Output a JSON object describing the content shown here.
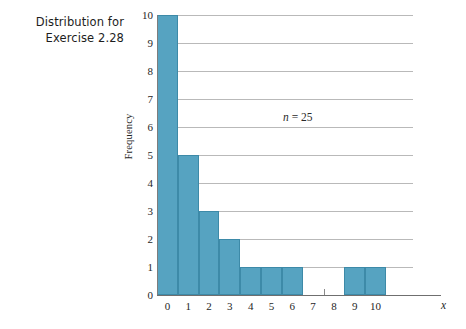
{
  "caption": {
    "line1": "Distribution for",
    "line2": "Exercise 2.28"
  },
  "annotation": {
    "symbol": "n",
    "equals": "=",
    "value": "25",
    "full": "n = 25"
  },
  "axis": {
    "y_title": "Frequency",
    "x_title": "x"
  },
  "colors": {
    "bar_fill": "#56a3c1",
    "bar_edge": "#3d8aa8",
    "grid": "#b9b9b9",
    "axis": "#6f6f6f",
    "background": "#ffffff",
    "text": "#262626"
  },
  "chart_data": {
    "type": "bar",
    "title": "Distribution for Exercise 2.28",
    "subtitle": "",
    "xlabel": "x",
    "ylabel": "Frequency",
    "categories": [
      "0",
      "1",
      "2",
      "3",
      "4",
      "5",
      "6",
      "7",
      "8",
      "9",
      "10"
    ],
    "x": [
      0,
      1,
      2,
      3,
      4,
      5,
      6,
      7,
      8,
      9,
      10
    ],
    "values": [
      10,
      5,
      3,
      2,
      1,
      1,
      1,
      0,
      0,
      1,
      1
    ],
    "xlim": [
      -0.5,
      11.8
    ],
    "ylim": [
      0,
      10
    ],
    "ytick_labels": [
      "0",
      "1",
      "2",
      "3",
      "4",
      "5",
      "6",
      "7",
      "8",
      "9",
      "10"
    ],
    "yticks": [
      0,
      1,
      2,
      3,
      4,
      5,
      6,
      7,
      8,
      9,
      10
    ],
    "xtick_labels": [
      "0",
      "1",
      "2",
      "3",
      "4",
      "5",
      "6",
      "7",
      "8",
      "9",
      "10"
    ],
    "xticks": [
      0,
      1,
      2,
      3,
      4,
      5,
      6,
      7,
      8,
      9,
      10
    ],
    "grid": "horizontal",
    "legend": "none",
    "annotations": [
      {
        "text": "n = 25",
        "x": 6.2,
        "y": 6.4
      }
    ],
    "bar_width": 1.0,
    "total_n": 25
  }
}
